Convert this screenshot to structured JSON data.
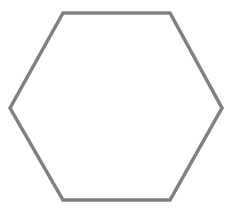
{
  "canvas": {
    "width": 238,
    "height": 223,
    "background_color": "#ffffff"
  },
  "figure": {
    "name": "hexagon",
    "label": "Hexagon",
    "shape_type": "polygon",
    "sides": 6,
    "orientation": "flat-top",
    "fill": "none",
    "stroke_color": "#808080",
    "stroke_width": 3.5,
    "vertices": [
      {
        "name": "left",
        "x": 10,
        "y": 108
      },
      {
        "name": "top-left",
        "x": 63,
        "y": 13
      },
      {
        "name": "top-right",
        "x": 170,
        "y": 13
      },
      {
        "name": "right",
        "x": 222,
        "y": 108
      },
      {
        "name": "bottom-right",
        "x": 170,
        "y": 200
      },
      {
        "name": "bottom-left",
        "x": 63,
        "y": 200
      }
    ],
    "points_attr": "10,108 63,13 170,13 222,108 170,200 63,200",
    "bounding_box": {
      "x": 10,
      "y": 13,
      "width": 212,
      "height": 187
    }
  }
}
